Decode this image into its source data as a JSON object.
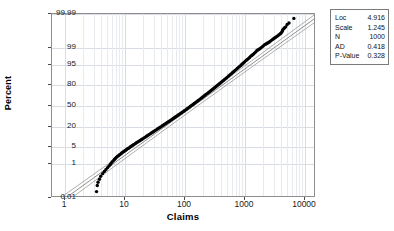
{
  "chart_data": {
    "type": "scatter",
    "plot_kind": "lognormal-probability-plot",
    "title": "",
    "xlabel": "Claims",
    "ylabel": "Percent",
    "x_scale": "log",
    "y_scale": "probability",
    "xlim": [
      1,
      20000
    ],
    "ylim": [
      0.01,
      99.99
    ],
    "grid": true,
    "xticks": [
      "1",
      "10",
      "100",
      "1000",
      "10000"
    ],
    "xtick_values": [
      1,
      10,
      100,
      1000,
      10000
    ],
    "yticks": [
      "99.99",
      "99",
      "95",
      "80",
      "50",
      "20",
      "5",
      "1",
      "0.01"
    ],
    "ytick_values": [
      99.99,
      99,
      95,
      80,
      50,
      20,
      5,
      1,
      0.01
    ],
    "legend_position": "outside-right-top",
    "series": [
      {
        "name": "data points",
        "marker": "filled-circle",
        "color": "#000000",
        "x": [
          3.4,
          3.5,
          3.6,
          3.8,
          4.0,
          4.3,
          4.6,
          4.9,
          5.2,
          5.5,
          5.8,
          6.0,
          6.2,
          6.5,
          6.8,
          7.0,
          7.3,
          7.6,
          8.0,
          8.3,
          8.7,
          9.0,
          9.4,
          9.8,
          10.2,
          10.6,
          11.0,
          11.5,
          12.0,
          12.5,
          13.0,
          13.6,
          14.2,
          14.8,
          15.5,
          16.2,
          17.0,
          17.8,
          18.6,
          19.5,
          20.4,
          21.4,
          22.4,
          23.5,
          24.6,
          25.8,
          27.0,
          28.3,
          29.7,
          31.1,
          32.6,
          34.2,
          35.8,
          37.6,
          39.4,
          41.3,
          43.3,
          45.4,
          47.6,
          49.9,
          52.3,
          54.9,
          57.5,
          60.3,
          63.2,
          66.3,
          69.5,
          72.9,
          76.4,
          80.1,
          84.0,
          88.1,
          92.4,
          96.9,
          101.6,
          106.5,
          111.7,
          117.1,
          122.8,
          128.8,
          135.0,
          141.6,
          148.5,
          155.7,
          163.3,
          171.2,
          179.6,
          188.3,
          197.5,
          207.1,
          217.2,
          227.8,
          238.9,
          250.5,
          262.7,
          275.5,
          288.9,
          303.0,
          317.8,
          333.3,
          349.6,
          366.6,
          384.5,
          403.3,
          422.9,
          443.5,
          465.1,
          487.8,
          511.5,
          536.4,
          562.6,
          590.0,
          618.7,
          648.8,
          680.4,
          713.5,
          748.3,
          784.7,
          823.0,
          863.0,
          905.1,
          949.2,
          995.4,
          1044.0,
          1094.8,
          1148.2,
          1204.1,
          1262.8,
          1324.4,
          1388.9,
          1456.6,
          1527.6,
          1602.0,
          1680.1,
          1762.0,
          1847.8,
          1937.9,
          2032.3,
          2131.3,
          2235.2,
          2344.2,
          2458.4,
          2578.2,
          2703.9,
          2835.6,
          2973.8,
          3118.7,
          3270.7,
          3430.1,
          3597.2,
          3772.5,
          3956.3,
          4149.1,
          4300.0,
          4420.0,
          4500.0,
          4600.0,
          4750.0,
          4900.0,
          5100.0,
          5400.0,
          5800.0,
          7000.0
        ],
        "y": [
          0.02,
          0.05,
          0.08,
          0.12,
          0.18,
          0.25,
          0.33,
          0.42,
          0.52,
          0.63,
          0.75,
          0.88,
          1.0,
          1.15,
          1.3,
          1.45,
          1.6,
          1.78,
          1.95,
          2.1,
          2.3,
          2.5,
          2.7,
          2.9,
          3.1,
          3.3,
          3.55,
          3.8,
          4.0,
          4.3,
          4.6,
          4.9,
          5.2,
          5.5,
          5.9,
          6.3,
          6.7,
          7.1,
          7.5,
          8.0,
          8.5,
          9.0,
          9.5,
          10.1,
          10.7,
          11.3,
          11.9,
          12.6,
          13.3,
          14.0,
          14.8,
          15.5,
          16.3,
          17.1,
          18.0,
          18.9,
          19.8,
          20.7,
          21.7,
          22.7,
          23.7,
          24.7,
          25.8,
          26.9,
          28.0,
          29.2,
          30.4,
          31.6,
          32.8,
          34.1,
          35.4,
          36.7,
          38.0,
          39.4,
          40.8,
          42.2,
          43.6,
          45.0,
          46.5,
          48.0,
          49.4,
          50.9,
          52.4,
          53.9,
          55.4,
          56.9,
          58.4,
          59.9,
          61.4,
          62.9,
          64.3,
          65.8,
          67.2,
          68.6,
          70.0,
          71.4,
          72.7,
          74.0,
          75.3,
          76.6,
          77.8,
          79.0,
          80.2,
          81.3,
          82.4,
          83.5,
          84.5,
          85.5,
          86.4,
          87.3,
          88.2,
          89.0,
          89.8,
          90.6,
          91.3,
          92.0,
          92.6,
          93.2,
          93.8,
          94.3,
          94.8,
          95.3,
          95.7,
          96.1,
          96.5,
          96.8,
          97.1,
          97.4,
          97.7,
          97.9,
          98.1,
          98.3,
          98.5,
          98.7,
          98.8,
          98.9,
          99.0,
          99.1,
          99.2,
          99.3,
          99.35,
          99.4,
          99.45,
          99.5,
          99.55,
          99.6,
          99.64,
          99.68,
          99.71,
          99.74,
          99.77,
          99.8,
          99.82,
          99.84,
          99.86,
          99.88,
          99.9,
          99.91,
          99.92,
          99.93,
          99.95,
          99.96,
          99.98
        ]
      }
    ],
    "fit_line": {
      "name": "lognormal fit",
      "color": "#808080",
      "x": [
        1.15,
        20000
      ],
      "y": [
        0.01,
        99.99
      ]
    },
    "confidence_bands": {
      "name": "95% CI",
      "color": "#9a9a9a",
      "count": 2
    },
    "stats": {
      "Loc": "4.916",
      "Scale": "1.245",
      "N": "1000",
      "AD": "0.418",
      "P-Value": "0.328"
    }
  },
  "stats_table": {
    "rows": [
      {
        "key": "Loc",
        "value": "4.916"
      },
      {
        "key": "Scale",
        "value": "1.245"
      },
      {
        "key": "N",
        "value": "1000"
      },
      {
        "key": "AD",
        "value": "0.418"
      },
      {
        "key": "P-Value",
        "value": "0.328"
      }
    ]
  },
  "axes": {
    "x_title": "Claims",
    "y_title": "Percent",
    "x_ticks": [
      "1",
      "10",
      "100",
      "1000",
      "10000"
    ],
    "y_ticks": [
      "99.99",
      "99",
      "95",
      "80",
      "50",
      "20",
      "5",
      "1",
      "0.01"
    ]
  },
  "title": ""
}
